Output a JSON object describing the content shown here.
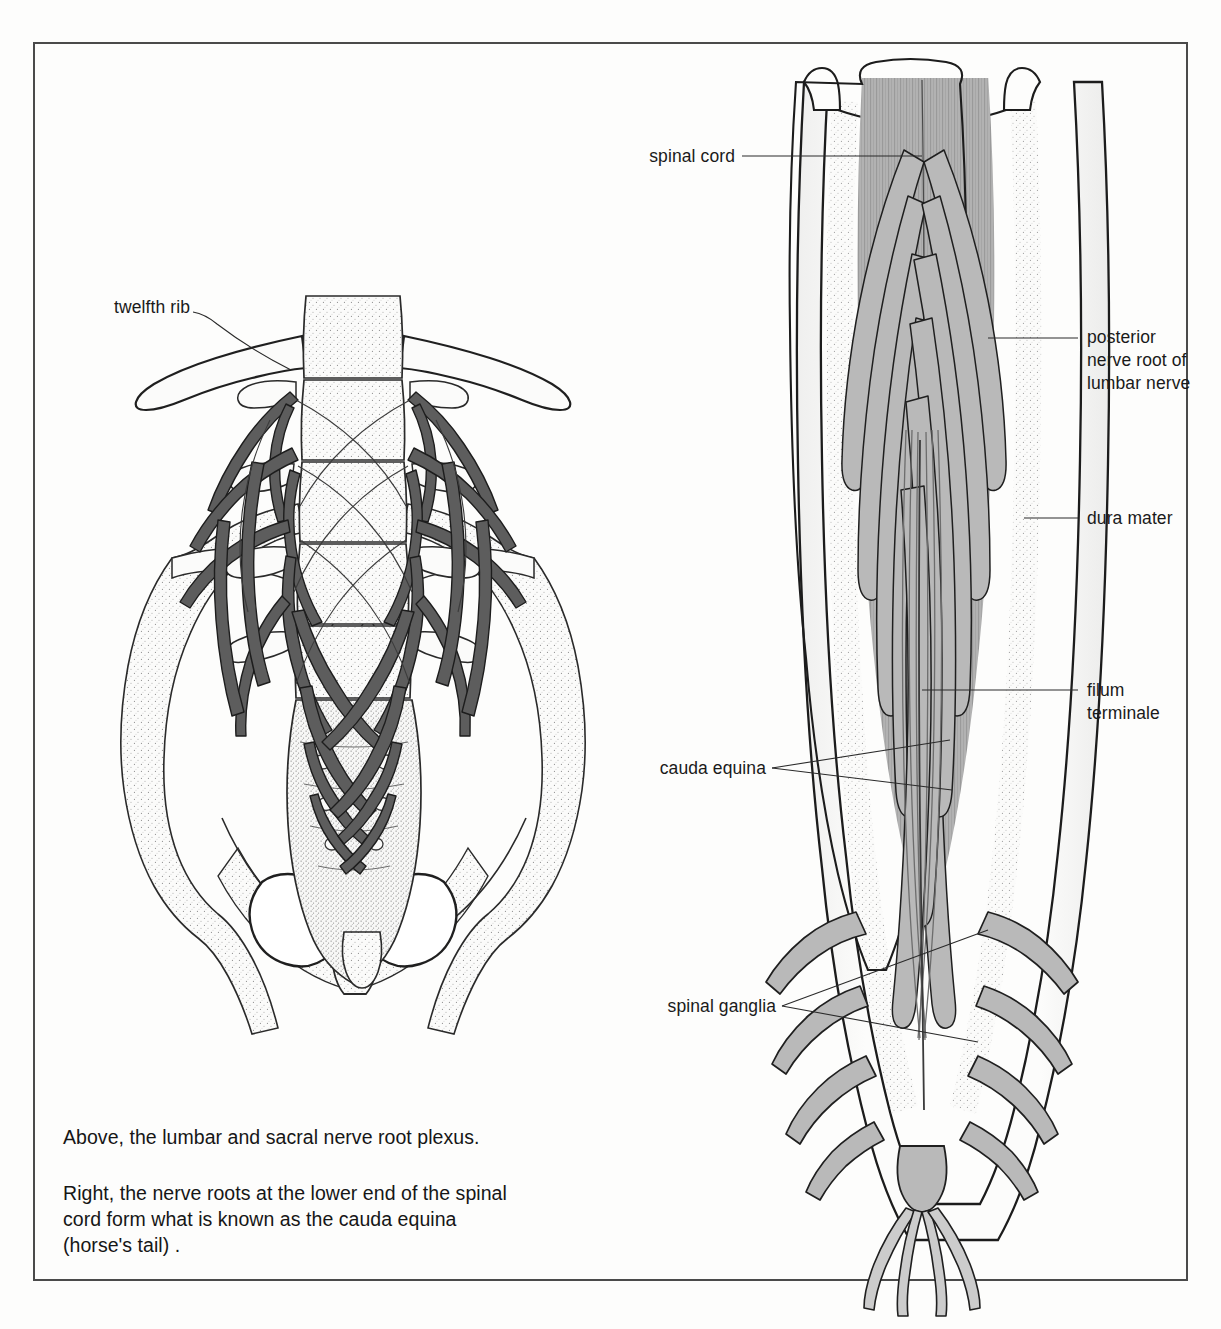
{
  "plate": {
    "background_color": "#fdfdfc",
    "frame_color": "#4a4a4a",
    "ink_color": "#1a1a1a",
    "bone_fill": "#fbfbfa",
    "nerve_dark_fill": "#5d5d5d",
    "tissue_gray_fill": "#b9b9b9",
    "cord_gray_fill": "#b0b0b0"
  },
  "labels": {
    "twelfth_rib": "twelfth rib",
    "spinal_cord": "spinal cord",
    "posterior_nerve_root": "posterior\nnerve root of\nlumbar nerve",
    "dura_mater": "dura mater",
    "filum_terminale": "filum\nterminale",
    "cauda_equina": "cauda equina",
    "spinal_ganglia": "spinal ganglia"
  },
  "caption": {
    "above": "Above, the lumbar and sacral nerve root plexus.",
    "right": "Right, the nerve roots at the lower end of the spinal\ncord form what is known as the cauda equina\n(horse's tail) ."
  },
  "figures": {
    "left": {
      "name": "lumbar and sacral nerve root plexus",
      "view": "anterior pelvis with lumbar vertebrae and nerve plexus",
      "parts": [
        "twelfth rib",
        "lumbar vertebrae",
        "sacrum",
        "ilium",
        "obturator foramen",
        "nerve plexus branches"
      ]
    },
    "right": {
      "name": "cauda equina within dura mater",
      "view": "posterior opened dural sac",
      "parts": [
        "spinal cord",
        "posterior nerve root of lumbar nerve",
        "dura mater",
        "filum terminale",
        "cauda equina",
        "spinal ganglia"
      ]
    }
  }
}
